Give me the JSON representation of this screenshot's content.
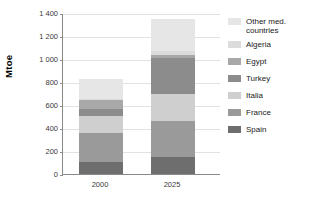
{
  "chart_data": {
    "type": "bar",
    "subtype": "stacked-bar",
    "title": "",
    "xlabel": "",
    "ylabel": "Mtoe",
    "categories": [
      "2000",
      "2025"
    ],
    "ylim": [
      0,
      1400
    ],
    "y_ticks": [
      0,
      200,
      400,
      600,
      800,
      1000,
      1200,
      1400
    ],
    "y_tick_labels": [
      "0",
      "200",
      "400",
      "600",
      "800",
      "1 000",
      "1 200",
      "1 400"
    ],
    "grid": true,
    "legend_position": "right",
    "stack_order_bottom_to_top": [
      "Spain",
      "France",
      "Italia",
      "Turkey",
      "Egypt",
      "Algeria",
      "Other med. countries"
    ],
    "series": [
      {
        "name": "Spain",
        "values": [
          105,
          145
        ],
        "color": "#6e6e6e"
      },
      {
        "name": "France",
        "values": [
          250,
          320
        ],
        "color": "#9a9a9a"
      },
      {
        "name": "Italia",
        "values": [
          150,
          235
        ],
        "color": "#cfcfcf"
      },
      {
        "name": "Turkey",
        "values": [
          60,
          310
        ],
        "color": "#8c8c8c"
      },
      {
        "name": "Egypt",
        "values": [
          75,
          25
        ],
        "color": "#a8a8a8"
      },
      {
        "name": "Algeria",
        "values": [
          15,
          35
        ],
        "color": "#dcdcdc"
      },
      {
        "name": "Other med. countries",
        "values": [
          175,
          280
        ],
        "color": "#e6e6e6"
      }
    ],
    "totals": [
      830,
      1350
    ]
  },
  "axes": {
    "y_title": "Mtoe"
  },
  "legend": {
    "items": [
      {
        "label": "Other med.\ncountries",
        "name": "other-med-countries",
        "two_line": true
      },
      {
        "label": "Algeria",
        "name": "algeria",
        "two_line": false
      },
      {
        "label": "Egypt",
        "name": "egypt",
        "two_line": false
      },
      {
        "label": "Turkey",
        "name": "turkey",
        "two_line": false
      },
      {
        "label": "Italia",
        "name": "italia",
        "two_line": false
      },
      {
        "label": "France",
        "name": "france",
        "two_line": false
      },
      {
        "label": "Spain",
        "name": "spain",
        "two_line": false
      }
    ]
  }
}
